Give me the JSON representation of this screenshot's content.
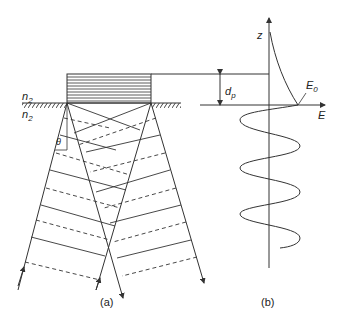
{
  "figure": {
    "panel_a": {
      "caption": "(a)",
      "labels": {
        "n_top": "n",
        "n_top_sub": "2",
        "n_bottom": "n",
        "n_bottom_sub": "2",
        "theta": "θ"
      }
    },
    "panel_b": {
      "caption": "(b)",
      "labels": {
        "z_axis": "z",
        "e_axis": "E",
        "d": "d",
        "d_sub": "p",
        "e0": "E",
        "e0_sub": "0"
      }
    },
    "colors": {
      "line": "#333333",
      "background": "#ffffff"
    }
  }
}
